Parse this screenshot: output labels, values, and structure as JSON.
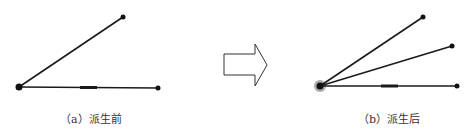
{
  "figure": {
    "panel_a": {
      "caption": "（a）派生前",
      "origin": [
        19,
        87
      ],
      "endpoints": [
        [
          123,
          17
        ],
        [
          158,
          88
        ]
      ],
      "thick_segment": [
        80,
        97
      ]
    },
    "panel_b": {
      "caption": "（b）派生后",
      "origin": [
        320,
        86
      ],
      "endpoints": [
        [
          423,
          17
        ],
        [
          452,
          46
        ],
        [
          457,
          86
        ]
      ],
      "thick_segment": [
        381,
        398
      ]
    },
    "arrow": {
      "direction": "right"
    },
    "colors": {
      "line": "#1a1a1a",
      "arrow_stroke": "#333333"
    }
  }
}
